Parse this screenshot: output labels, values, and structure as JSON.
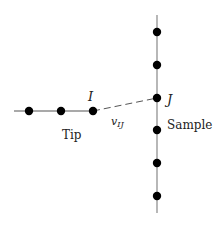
{
  "diagram": {
    "labels": {
      "tip_atom": "I",
      "sample_atom": "J",
      "coupling": "v",
      "coupling_sub": "IJ",
      "tip": "Tip",
      "sample": "Sample"
    },
    "tip_chain": {
      "line": {
        "x1": 14,
        "y1": 111,
        "x2": 93,
        "y2": 111
      },
      "atoms": [
        {
          "x": 29,
          "y": 111
        },
        {
          "x": 61,
          "y": 111
        },
        {
          "x": 93,
          "y": 111
        }
      ]
    },
    "sample_chain": {
      "line": {
        "x1": 157,
        "y1": 15,
        "x2": 157,
        "y2": 213
      },
      "atoms": [
        {
          "x": 157,
          "y": 32
        },
        {
          "x": 157,
          "y": 65
        },
        {
          "x": 157,
          "y": 98
        },
        {
          "x": 157,
          "y": 130
        },
        {
          "x": 157,
          "y": 163
        },
        {
          "x": 157,
          "y": 196
        }
      ]
    },
    "coupling_line": {
      "x1": 93,
      "y1": 111,
      "x2": 157,
      "y2": 98,
      "style": "dashed"
    },
    "colors": {
      "line": "#888888",
      "atom": "#000000",
      "text": "#222222"
    }
  }
}
